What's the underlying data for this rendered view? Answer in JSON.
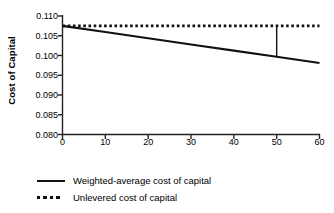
{
  "chart_data": {
    "type": "line",
    "title": "",
    "xlabel": "Debt as % of Total Capital",
    "ylabel": "Cost of Capital",
    "xlim": [
      0,
      60
    ],
    "ylim": [
      0.08,
      0.11
    ],
    "xticks": [
      "0",
      "10",
      "20",
      "30",
      "40",
      "50",
      "60"
    ],
    "xtick_values": [
      0,
      10,
      20,
      30,
      40,
      50,
      60
    ],
    "yticks": [
      "0.080",
      "0.085",
      "0.090",
      "0.095",
      "0.100",
      "0.105",
      "0.110"
    ],
    "ytick_values": [
      0.08,
      0.085,
      0.09,
      0.095,
      0.1,
      0.105,
      0.11
    ],
    "grid": false,
    "legend_position": "below-left",
    "series": [
      {
        "name": "Weighted-average cost of capital",
        "style": "solid",
        "color": "#111111",
        "x": [
          0,
          10,
          20,
          30,
          40,
          50,
          60
        ],
        "values": [
          0.1075,
          0.10593,
          0.10437,
          0.1028,
          0.10123,
          0.09967,
          0.0981
        ]
      },
      {
        "name": "Unlevered cost of capital",
        "style": "dotted",
        "color": "#111111",
        "x": [
          0,
          60
        ],
        "values": [
          0.1075,
          0.1075
        ]
      }
    ],
    "annotations": [
      {
        "name": "value-of-leverage-drop-line",
        "type": "vertical-segment",
        "x": 50,
        "y_top": 0.1075,
        "y_bottom": 0.09967,
        "color": "#111111"
      }
    ]
  },
  "legend": {
    "items": [
      {
        "label": "Weighted-average cost of capital",
        "style": "solid"
      },
      {
        "label": "Unlevered cost of capital",
        "style": "dotted"
      }
    ]
  }
}
